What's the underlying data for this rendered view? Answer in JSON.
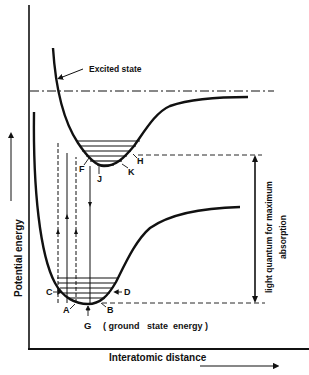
{
  "diagram": {
    "title": "",
    "type": "potential-energy-curves",
    "axes": {
      "y_label": "Potential   energy",
      "x_label": "Interatomic distance"
    },
    "curves": [
      {
        "name": "excited-state-curve",
        "label": "Excited state"
      },
      {
        "name": "ground-state-curve",
        "label": ""
      }
    ],
    "annotations": {
      "excited_state": "Excited  state",
      "ground_state_energy": "( ground   state  energy )",
      "light_quantum_line1": "light  quantum  for  maximum",
      "light_quantum_line2": "absorption"
    },
    "point_labels": {
      "A": "A",
      "B": "B",
      "C": "C",
      "D": "D",
      "G": "G",
      "F": "F",
      "H": "H",
      "J": "J",
      "K": "K"
    },
    "colors": {
      "ink": "#111111",
      "background": "#ffffff"
    }
  }
}
